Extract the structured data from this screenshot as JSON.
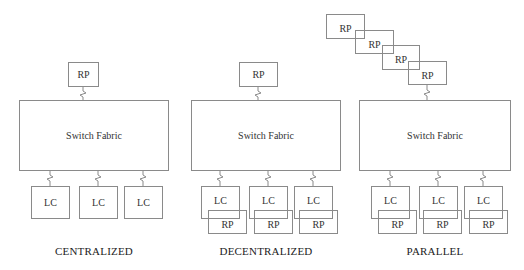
{
  "diagram": {
    "panels": [
      {
        "caption": "CENTRALIZED",
        "fabric_label": "Switch Fabric",
        "rp_label": "RP",
        "line_cards": [
          "LC",
          "LC",
          "LC"
        ]
      },
      {
        "caption": "DECENTRALIZED",
        "fabric_label": "Switch Fabric",
        "rp_label": "RP",
        "line_cards": [
          "LC",
          "LC",
          "LC"
        ],
        "lc_rps": [
          "RP",
          "RP",
          "RP"
        ]
      },
      {
        "caption": "PARALLEL",
        "fabric_label": "Switch Fabric",
        "rp_stack": [
          "RP",
          "RP",
          "RP",
          "RP"
        ],
        "line_cards": [
          "LC",
          "LC",
          "LC"
        ],
        "lc_rps": [
          "RP",
          "RP",
          "RP"
        ]
      }
    ],
    "colors": {
      "line": "#8a8a8a",
      "text": "#333333",
      "background": "#ffffff"
    }
  }
}
